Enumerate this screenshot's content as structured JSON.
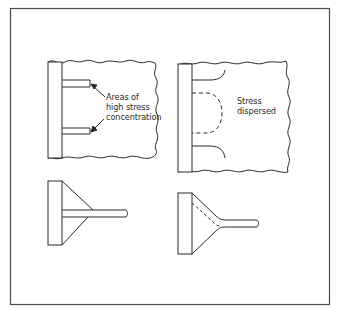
{
  "figure": {
    "panels": [
      {
        "id": "top-left",
        "description": "Plain T-joint with stiffeners, stress concentrated at corners",
        "label_lines": [
          "Areas of",
          "high stress",
          "concentration"
        ]
      },
      {
        "id": "top-right",
        "description": "Radiused stiffeners, stress dispersed",
        "label_lines": [
          "Stress",
          "dispersed"
        ]
      },
      {
        "id": "bottom-left",
        "description": "Straight gusset bracket joint"
      },
      {
        "id": "bottom-right",
        "description": "Curved gusset bracket joint with dashed stress path"
      }
    ],
    "caption": ""
  },
  "colors": {
    "line": "#2a2a2a",
    "frame": "#4a4a4a",
    "background": "#ffffff"
  }
}
